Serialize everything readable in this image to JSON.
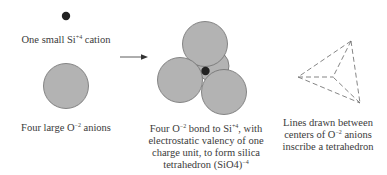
{
  "diagram": {
    "panels": [
      {
        "id": "cation",
        "label_parts": [
          "One small Si",
          "+4",
          " cation"
        ]
      },
      {
        "id": "anions",
        "label_parts": [
          "Four large O",
          "−2",
          " anions"
        ]
      },
      {
        "id": "bond",
        "label_lines": [
          [
            "Four O",
            "−2",
            " bond to Si",
            "+4",
            ", with"
          ],
          [
            "electrostatic valency of one"
          ],
          [
            "charge unit, to form silica"
          ],
          [
            "tetrahedron (SiO4)",
            "−4",
            ""
          ]
        ]
      },
      {
        "id": "lines",
        "label_lines": [
          [
            "Lines drawn between"
          ],
          [
            "centers of O",
            "−2",
            " anions"
          ],
          [
            "inscribe a tetrahedron"
          ]
        ]
      }
    ],
    "colors": {
      "anion_fill": "#b3b3b3",
      "anion_stroke": "#6e6e6e",
      "cation_fill": "#222222",
      "arrow": "#333333",
      "dashed_line": "#666666"
    },
    "icons": {
      "arrow": "right-arrow-icon"
    }
  }
}
